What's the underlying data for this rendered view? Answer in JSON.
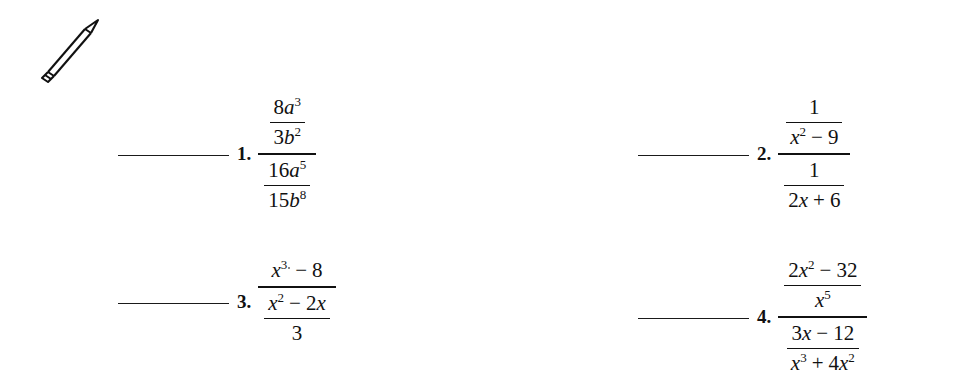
{
  "page": {
    "background_color": "#ffffff",
    "ink_color": "#111111",
    "icon": "pencil-icon"
  },
  "problems": [
    {
      "number": "1.",
      "blank_label": "",
      "expression": {
        "type": "complex-fraction",
        "numerator": {
          "type": "fraction",
          "numerator": "8a³",
          "denominator": "3b²"
        },
        "denominator": {
          "type": "fraction",
          "numerator": "16a⁵",
          "denominator": "15b⁸"
        }
      }
    },
    {
      "number": "2.",
      "blank_label": "",
      "expression": {
        "type": "complex-fraction",
        "numerator": {
          "type": "fraction",
          "numerator": "1",
          "denominator": "x² − 9"
        },
        "denominator": {
          "type": "fraction",
          "numerator": "1",
          "denominator": "2x + 6"
        }
      }
    },
    {
      "number": "3.",
      "blank_label": "",
      "expression": {
        "type": "complex-fraction",
        "numerator": "x³ − 8",
        "denominator": {
          "type": "fraction",
          "numerator": "x² − 2x",
          "denominator": "3"
        }
      }
    },
    {
      "number": "4.",
      "blank_label": "",
      "expression": {
        "type": "complex-fraction",
        "numerator": {
          "type": "fraction",
          "numerator": "2x² − 32",
          "denominator": "x⁵"
        },
        "denominator": {
          "type": "fraction",
          "numerator": "3x − 12",
          "denominator": "x³ + 4x²"
        }
      }
    }
  ]
}
